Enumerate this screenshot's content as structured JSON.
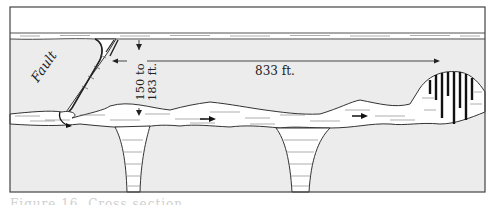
{
  "figure": {
    "labels": {
      "fault": "Fault",
      "depth": "150 to",
      "depth_line2": "183 ft.",
      "distance": "833 ft."
    },
    "caption": "Figure 16. Cross section"
  },
  "colors": {
    "rock": "#ececec",
    "sky": "#ffffff",
    "ink": "#2a2a2a",
    "water": "#ffffff",
    "frame": "#444444"
  }
}
